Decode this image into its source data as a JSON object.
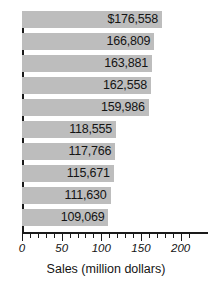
{
  "chart_data": {
    "type": "bar",
    "orientation": "horizontal",
    "title": "",
    "xlabel": "Sales (million dollars)",
    "ylabel": "",
    "xlim": [
      0,
      215
    ],
    "xticks": [
      0,
      50,
      100,
      150,
      200
    ],
    "xtick_labels": [
      "0",
      "50",
      "100",
      "150",
      "200"
    ],
    "minor_tick_step": 10,
    "grid": false,
    "legend": null,
    "categories": [
      "",
      "",
      "",
      "",
      "",
      "",
      "",
      "",
      "",
      ""
    ],
    "values": [
      176558,
      166809,
      163881,
      162558,
      159986,
      118555,
      117766,
      115671,
      111630,
      109069
    ],
    "plotted_values": [
      176.558,
      166.809,
      163.881,
      162.558,
      159.986,
      118.555,
      117.766,
      115.671,
      111.63,
      109.069
    ],
    "data_labels": [
      "$176,558",
      "166,809",
      "163,881",
      "162,558",
      "159,986",
      "118,555",
      "117,766",
      "115,671",
      "111,630",
      "109,069"
    ],
    "bar_color": "#bdbdbd",
    "axis_color": "#1a1a1a",
    "label_color": "#141414",
    "units": "million dollars"
  }
}
